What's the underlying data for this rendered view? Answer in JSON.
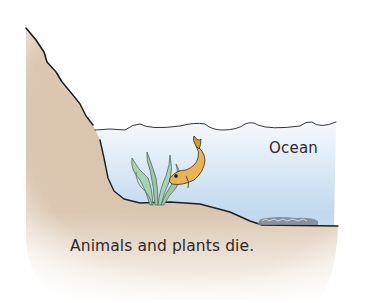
{
  "diagram": {
    "labels": {
      "ocean": "Ocean",
      "caption": "Animals and plants die."
    },
    "elements": [
      {
        "name": "cliff",
        "description": "steep rocky land slope on the left"
      },
      {
        "name": "ocean-water",
        "description": "light blue water body with wavy surface"
      },
      {
        "name": "seaweed",
        "description": "green aquatic plant on sea floor"
      },
      {
        "name": "fish",
        "description": "yellow-orange fish diving downward"
      },
      {
        "name": "sediment-remains",
        "description": "grey pile of remains on sea floor at right"
      }
    ],
    "colors": {
      "land": "#d9c4ae",
      "land_light": "#efe4d8",
      "water_top": "#f3f7fb",
      "water_bottom": "#bcd6ef",
      "outline": "#1e1e1e",
      "plant": "#9cc7a8",
      "fish": "#e8b45a",
      "remains": "#7b8590"
    }
  }
}
